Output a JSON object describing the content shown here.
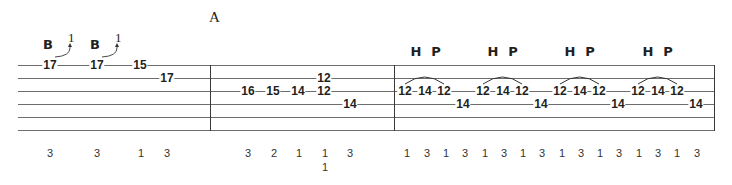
{
  "section_label": "A",
  "staff": {
    "left": 18,
    "right": 714,
    "line_y": [
      65,
      78,
      91,
      104,
      117,
      130
    ],
    "barlines_x": [
      210,
      394,
      714
    ]
  },
  "measures": [
    {
      "notes": [
        {
          "fret": "17",
          "x": 50,
          "string": 1,
          "bend": {
            "label": "B",
            "amount": "1"
          }
        },
        {
          "fret": "17",
          "x": 97,
          "string": 1,
          "bend": {
            "label": "B",
            "amount": "1"
          }
        },
        {
          "fret": "15",
          "x": 140,
          "string": 1
        },
        {
          "fret": "17",
          "x": 167,
          "string": 2
        }
      ],
      "fingerings": [
        {
          "x": 50,
          "values": [
            "3"
          ]
        },
        {
          "x": 97,
          "values": [
            "3"
          ]
        },
        {
          "x": 141,
          "values": [
            "1"
          ]
        },
        {
          "x": 167,
          "values": [
            "3"
          ]
        }
      ]
    },
    {
      "notes": [
        {
          "fret": "16",
          "x": 248,
          "string": 3
        },
        {
          "fret": "15",
          "x": 273,
          "string": 3
        },
        {
          "fret": "14",
          "x": 298,
          "string": 3
        },
        {
          "fret": "12",
          "x": 324,
          "string": 2
        },
        {
          "fret": "12",
          "x": 324,
          "string": 3
        },
        {
          "fret": "14",
          "x": 350,
          "string": 4
        }
      ],
      "fingerings": [
        {
          "x": 248,
          "values": [
            "3"
          ]
        },
        {
          "x": 274,
          "values": [
            "2"
          ]
        },
        {
          "x": 299,
          "values": [
            "1"
          ]
        },
        {
          "x": 325,
          "values": [
            "1",
            "1"
          ]
        },
        {
          "x": 350,
          "values": [
            "3"
          ]
        }
      ]
    },
    {
      "groups": [
        {
          "hp": [
            "H",
            "P"
          ],
          "hp_x": [
            416,
            436
          ],
          "notes": [
            {
              "fret": "12",
              "x": 405,
              "string": 3
            },
            {
              "fret": "14",
              "x": 425,
              "string": 3
            },
            {
              "fret": "12",
              "x": 444,
              "string": 3
            },
            {
              "fret": "14",
              "x": 463,
              "string": 4
            }
          ]
        },
        {
          "hp": [
            "H",
            "P"
          ],
          "hp_x": [
            493,
            513
          ],
          "notes": [
            {
              "fret": "12",
              "x": 483,
              "string": 3
            },
            {
              "fret": "14",
              "x": 503,
              "string": 3
            },
            {
              "fret": "12",
              "x": 522,
              "string": 3
            },
            {
              "fret": "14",
              "x": 541,
              "string": 4
            }
          ]
        },
        {
          "hp": [
            "H",
            "P"
          ],
          "hp_x": [
            570,
            590
          ],
          "notes": [
            {
              "fret": "12",
              "x": 560,
              "string": 3
            },
            {
              "fret": "14",
              "x": 580,
              "string": 3
            },
            {
              "fret": "12",
              "x": 599,
              "string": 3
            },
            {
              "fret": "14",
              "x": 618,
              "string": 4
            }
          ]
        },
        {
          "hp": [
            "H",
            "P"
          ],
          "hp_x": [
            648,
            668
          ],
          "notes": [
            {
              "fret": "12",
              "x": 638,
              "string": 3
            },
            {
              "fret": "14",
              "x": 658,
              "string": 3
            },
            {
              "fret": "12",
              "x": 677,
              "string": 3
            },
            {
              "fret": "14",
              "x": 696,
              "string": 4
            }
          ]
        }
      ],
      "fingerings": [
        {
          "x": 407,
          "values": [
            "1"
          ]
        },
        {
          "x": 427,
          "values": [
            "3"
          ]
        },
        {
          "x": 446,
          "values": [
            "1"
          ]
        },
        {
          "x": 465,
          "values": [
            "3"
          ]
        },
        {
          "x": 485,
          "values": [
            "1"
          ]
        },
        {
          "x": 504,
          "values": [
            "3"
          ]
        },
        {
          "x": 523,
          "values": [
            "1"
          ]
        },
        {
          "x": 542,
          "values": [
            "3"
          ]
        },
        {
          "x": 562,
          "values": [
            "1"
          ]
        },
        {
          "x": 581,
          "values": [
            "3"
          ]
        },
        {
          "x": 600,
          "values": [
            "1"
          ]
        },
        {
          "x": 619,
          "values": [
            "3"
          ]
        },
        {
          "x": 639,
          "values": [
            "1"
          ]
        },
        {
          "x": 658,
          "values": [
            "3"
          ]
        },
        {
          "x": 677,
          "values": [
            "1"
          ]
        },
        {
          "x": 697,
          "values": [
            "3"
          ]
        }
      ]
    }
  ],
  "fingering_row_y": [
    148,
    162
  ]
}
